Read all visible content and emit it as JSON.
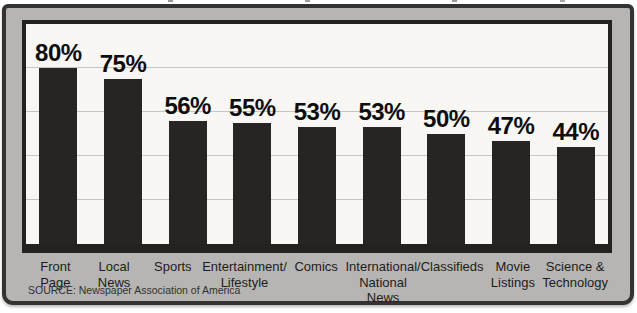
{
  "colors": {
    "bar": "#262524",
    "frame_fill": "#b6b5b3",
    "frame_border": "#343331",
    "panel_border": "#232220",
    "plot_background": "#f8f7f4",
    "gridline": "#c6c5c2"
  },
  "source_note": "SOURCE: Newspaper Association of America",
  "chart_data": {
    "type": "bar",
    "title": "",
    "xlabel": "",
    "ylabel": "",
    "categories": [
      "Front\nPage",
      "Local\nNews",
      "Sports",
      "Entertainment/\nLifestyle",
      "Comics",
      "International/\nNational News",
      "Classifieds",
      "Movie\nListings",
      "Science &\nTechnology"
    ],
    "values": [
      80,
      75,
      56,
      55,
      53,
      53,
      50,
      47,
      44
    ],
    "value_labels": [
      "80%",
      "75%",
      "56%",
      "55%",
      "53%",
      "53%",
      "50%",
      "47%",
      "44%"
    ],
    "ylim": [
      0,
      100
    ],
    "grid": true,
    "gridlines_pct": [
      20,
      40,
      60,
      80
    ],
    "legend_position": "none",
    "source": "SOURCE: Newspaper Association of America"
  }
}
